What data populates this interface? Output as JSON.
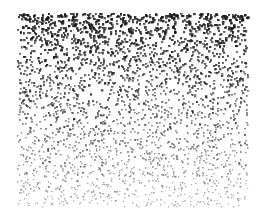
{
  "image": {
    "description": "Stippled dot gradient: dense dark dots at top fading to sparse light dots at bottom",
    "background": "#ffffff",
    "dot_color": "#1a1a1a",
    "region": {
      "x": 17,
      "y": 13,
      "width": 230,
      "height": 193
    },
    "density_top": 0.085,
    "density_bottom": 0.035,
    "opacity_top": 0.95,
    "opacity_bottom": 0.35,
    "dot_size_top": 2.2,
    "dot_size_bottom": 1.3
  }
}
